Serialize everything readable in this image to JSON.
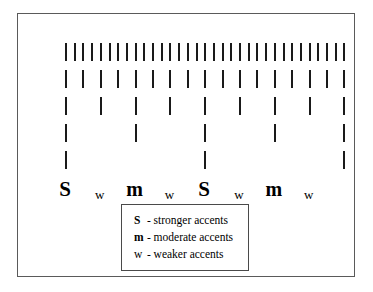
{
  "diagram": {
    "type": "metrical-grid",
    "rows": [
      {
        "level": 1,
        "count": 33,
        "start_x": 47,
        "spacing": 8.7,
        "y": 29
      },
      {
        "level": 2,
        "count": 17,
        "start_x": 47,
        "spacing": 17.4,
        "y": 56
      },
      {
        "level": 3,
        "count": 9,
        "start_x": 47,
        "spacing": 34.8,
        "y": 83
      },
      {
        "level": 4,
        "count": 5,
        "start_x": 47,
        "spacing": 69.6,
        "y": 110
      },
      {
        "level": 5,
        "count": 3,
        "start_x": 47,
        "spacing": 139.2,
        "y": 137
      }
    ],
    "labels": [
      {
        "text": "S",
        "strength": "stronger",
        "x": 47
      },
      {
        "text": "w",
        "strength": "weaker",
        "x": 81.8
      },
      {
        "text": "m",
        "strength": "moderate",
        "x": 116.6
      },
      {
        "text": "w",
        "strength": "weaker",
        "x": 151.4
      },
      {
        "text": "S",
        "strength": "stronger",
        "x": 186.2
      },
      {
        "text": "w",
        "strength": "weaker",
        "x": 221
      },
      {
        "text": "m",
        "strength": "moderate",
        "x": 255.8
      },
      {
        "text": "w",
        "strength": "weaker",
        "x": 290.6
      }
    ],
    "label_row_y": 163
  },
  "legend": {
    "entries": [
      {
        "key": "S",
        "separator": "-",
        "description": "stronger accents"
      },
      {
        "key": "m",
        "separator": "-",
        "description": "moderate accents"
      },
      {
        "key": "w",
        "separator": "-",
        "description": "weaker accents"
      }
    ]
  },
  "colors": {
    "tick": "#1a1a1a",
    "frame_border": "#5a5a5a",
    "legend_border": "#4a4a4a",
    "background": "#ffffff",
    "text": "#000000"
  }
}
